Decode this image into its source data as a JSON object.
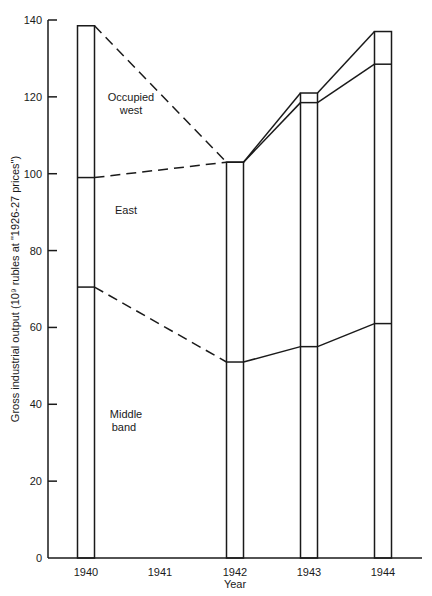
{
  "chart_data": {
    "type": "area",
    "title": "",
    "xlabel": "Year",
    "ylabel": "Gross industrial output (10⁹ rubles at \"1926-27 prices\")",
    "x_ticks": [
      "1940",
      "1941",
      "1942",
      "1943",
      "1944"
    ],
    "y_ticks": [
      0,
      20,
      40,
      60,
      80,
      100,
      120,
      140
    ],
    "ylim": [
      0,
      140
    ],
    "grid": false,
    "legend": "none (inline region labels)",
    "categories": [
      "1940",
      "1942",
      "1943",
      "1944"
    ],
    "boundaries": [
      {
        "name": "Middle band (top)",
        "values": [
          70.5,
          51,
          55,
          61
        ]
      },
      {
        "name": "East (top)",
        "values": [
          99,
          103,
          118.5,
          128.5
        ]
      },
      {
        "name": "Occupied west (top / total)",
        "values": [
          138.5,
          103,
          121,
          137
        ]
      }
    ],
    "series": [
      {
        "name": "Middle band",
        "values": [
          70.5,
          51,
          55,
          61
        ]
      },
      {
        "name": "East",
        "values": [
          28.5,
          52,
          63.5,
          67.5
        ]
      },
      {
        "name": "Occupied west",
        "values": [
          39.5,
          0,
          2.5,
          8.5
        ]
      }
    ],
    "annotations": [
      {
        "text": "Occupied west",
        "region": "top band"
      },
      {
        "text": "East",
        "region": "middle band"
      },
      {
        "text": "Middle band",
        "region": "bottom band"
      }
    ],
    "line_style_notes": "Segments from 1940 to 1942 are dashed; segments from 1942 onward are solid. Each year is drawn as a narrow vertical bar."
  },
  "labels": {
    "ylabel": "Gross industrial output (10⁹ rubles at \"1926-27 prices\")",
    "xlabel": "Year",
    "region_occupied_line1": "Occupied",
    "region_occupied_line2": "west",
    "region_east": "East",
    "region_middle_line1": "Middle",
    "region_middle_line2": "band"
  }
}
